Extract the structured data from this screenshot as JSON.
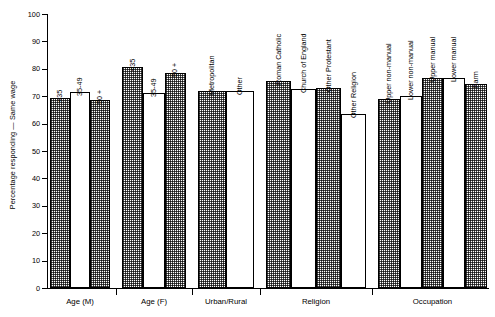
{
  "chart_data": {
    "type": "bar",
    "title": "",
    "xlabel": "",
    "ylabel": "Percentage responding — Same wage",
    "ylim": [
      0,
      100
    ],
    "yticks": [
      0,
      10,
      20,
      30,
      40,
      50,
      60,
      70,
      80,
      90,
      100
    ],
    "grid": false,
    "legend": "none",
    "categories": [
      "<35",
      "35-49",
      "50 +",
      "<35",
      "35-49",
      "50 +",
      "Metropolitan",
      "Other",
      "Roman Catholic",
      "Church of England",
      "Other Protestant",
      "Other Religion",
      "Upper non-manual",
      "Lower non-manual",
      "Upper manual",
      "Lower manual",
      "Farm"
    ],
    "values": [
      69.5,
      71.5,
      68.5,
      80.5,
      71.0,
      78.5,
      72.0,
      72.0,
      75.5,
      72.5,
      73.0,
      63.5,
      69.0,
      70.0,
      76.5,
      76.5,
      74.5
    ],
    "groups": [
      {
        "label": "Age (M)",
        "bars": [
          {
            "label": "<35",
            "value": 69.5,
            "fill": "hatch"
          },
          {
            "label": "35-49",
            "value": 71.5,
            "fill": "plain"
          },
          {
            "label": "50 +",
            "value": 68.5,
            "fill": "hatch"
          }
        ]
      },
      {
        "label": "Age (F)",
        "bars": [
          {
            "label": "<35",
            "value": 80.5,
            "fill": "hatch"
          },
          {
            "label": "35-49",
            "value": 71.0,
            "fill": "plain"
          },
          {
            "label": "50 +",
            "value": 78.5,
            "fill": "hatch"
          }
        ]
      },
      {
        "label": "Urban/Rural",
        "bars": [
          {
            "label": "Metropolitan",
            "value": 72.0,
            "fill": "hatch"
          },
          {
            "label": "Other",
            "value": 72.0,
            "fill": "plain"
          }
        ]
      },
      {
        "label": "Religion",
        "bars": [
          {
            "label": "Roman Catholic",
            "value": 75.5,
            "fill": "hatch"
          },
          {
            "label": "Church of England",
            "value": 72.5,
            "fill": "plain"
          },
          {
            "label": "Other Protestant",
            "value": 73.0,
            "fill": "hatch"
          },
          {
            "label": "Other Religion",
            "value": 63.5,
            "fill": "plain"
          }
        ]
      },
      {
        "label": "Occupation",
        "bars": [
          {
            "label": "Upper non-manual",
            "value": 69.0,
            "fill": "hatch"
          },
          {
            "label": "Lower non-manual",
            "value": 70.0,
            "fill": "plain"
          },
          {
            "label": "Upper manual",
            "value": 76.5,
            "fill": "hatch"
          },
          {
            "label": "Lower manual",
            "value": 76.5,
            "fill": "plain"
          },
          {
            "label": "Farm",
            "value": 74.5,
            "fill": "hatch"
          }
        ]
      }
    ],
    "colors": {
      "axis": "#000000",
      "bar_outline": "#000000",
      "bar_hatch": "#000000",
      "bar_plain": "#ffffff",
      "background": "#ffffff"
    }
  }
}
